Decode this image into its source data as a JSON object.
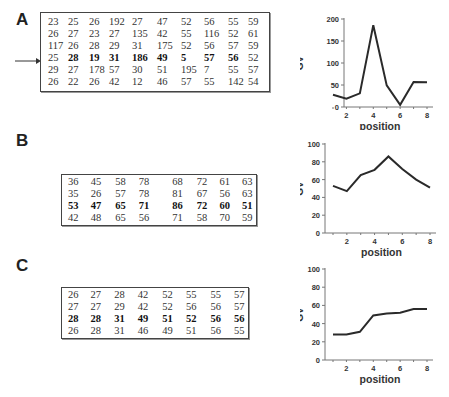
{
  "panels": [
    {
      "label": "A",
      "table": [
        [
          "23",
          "25",
          "26",
          "192",
          "27",
          "47",
          "52",
          "56",
          "55",
          "59"
        ],
        [
          "26",
          "27",
          "23",
          "27",
          "135",
          "42",
          "55",
          "116",
          "52",
          "61"
        ],
        [
          "117",
          "26",
          "28",
          "29",
          "31",
          "175",
          "52",
          "56",
          "57",
          "59"
        ],
        [
          "25",
          "28",
          "19",
          "31",
          "186",
          "49",
          "5",
          "57",
          "56",
          "52"
        ],
        [
          "29",
          "27",
          "178",
          "57",
          "30",
          "51",
          "195",
          "7",
          "55",
          "57"
        ],
        [
          "26",
          "22",
          "26",
          "42",
          "12",
          "46",
          "57",
          "55",
          "142",
          "54"
        ]
      ],
      "bold_row": 3,
      "bold_cols_from": 1,
      "bold_cols_to": 8,
      "arrow_row": 3
    },
    {
      "label": "B",
      "table": [
        [
          "36",
          "45",
          "58",
          "78",
          "68",
          "72",
          "61",
          "63"
        ],
        [
          "35",
          "26",
          "57",
          "78",
          "81",
          "67",
          "56",
          "63"
        ],
        [
          "53",
          "47",
          "65",
          "71",
          "86",
          "72",
          "60",
          "51"
        ],
        [
          "42",
          "48",
          "65",
          "56",
          "71",
          "58",
          "70",
          "59"
        ]
      ],
      "bold_row": 2
    },
    {
      "label": "C",
      "table": [
        [
          "26",
          "27",
          "28",
          "42",
          "52",
          "55",
          "55",
          "57"
        ],
        [
          "27",
          "27",
          "29",
          "42",
          "52",
          "56",
          "56",
          "57"
        ],
        [
          "28",
          "28",
          "31",
          "49",
          "51",
          "52",
          "56",
          "56"
        ],
        [
          "26",
          "28",
          "31",
          "46",
          "49",
          "51",
          "56",
          "55"
        ]
      ],
      "bold_row": 2
    }
  ],
  "chart_data": [
    {
      "type": "line",
      "panel": "A",
      "x": [
        1,
        2,
        3,
        4,
        5,
        6,
        7,
        8
      ],
      "values": [
        28,
        19,
        31,
        186,
        49,
        5,
        57,
        56
      ],
      "xlabel": "position",
      "ylabel": "GV",
      "ylim": [
        0,
        200
      ],
      "yticks": [
        0,
        50,
        100,
        150,
        200
      ],
      "xticks": [
        2,
        4,
        6,
        8
      ],
      "grid": false
    },
    {
      "type": "line",
      "panel": "B",
      "x": [
        1,
        2,
        3,
        4,
        5,
        6,
        7,
        8
      ],
      "values": [
        53,
        47,
        65,
        71,
        86,
        72,
        60,
        51
      ],
      "xlabel": "position",
      "ylabel": "GV",
      "ylim": [
        0,
        100
      ],
      "yticks": [
        0,
        20,
        40,
        60,
        80,
        100
      ],
      "xticks": [
        2,
        4,
        6,
        8
      ],
      "grid": false
    },
    {
      "type": "line",
      "panel": "C",
      "x": [
        1,
        2,
        3,
        4,
        5,
        6,
        7,
        8
      ],
      "values": [
        28,
        28,
        31,
        49,
        51,
        52,
        56,
        56
      ],
      "xlabel": "position",
      "ylabel": "GV",
      "ylim": [
        0,
        100
      ],
      "yticks": [
        0,
        20,
        40,
        60,
        80,
        100
      ],
      "xticks": [
        2,
        4,
        6,
        8
      ],
      "grid": false
    }
  ]
}
